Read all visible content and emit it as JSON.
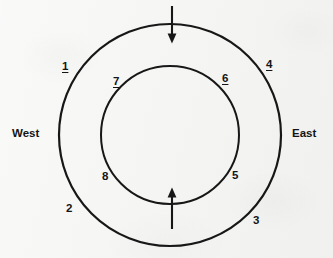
{
  "figure": {
    "type": "concentric-circles-diagram",
    "background_color": "#f3f3f1",
    "stroke_color": "#171717",
    "outer_circle": {
      "center_x": 170,
      "center_y": 135,
      "radius": 111,
      "stroke_width": 2.2
    },
    "inner_circle": {
      "center_x": 170,
      "center_y": 135,
      "radius": 69,
      "stroke_width": 2.0
    },
    "direction_labels": {
      "west": "West",
      "east": "East"
    },
    "numbered_points": [
      {
        "id": "1",
        "label": "1",
        "underlined": true,
        "x": 62,
        "y": 61
      },
      {
        "id": "2",
        "label": "2",
        "underlined": false,
        "x": 66,
        "y": 203
      },
      {
        "id": "3",
        "label": "3",
        "underlined": false,
        "x": 253,
        "y": 215
      },
      {
        "id": "4",
        "label": "4",
        "underlined": true,
        "x": 266,
        "y": 59
      },
      {
        "id": "5",
        "label": "5",
        "underlined": false,
        "x": 232,
        "y": 170
      },
      {
        "id": "6",
        "label": "6",
        "underlined": true,
        "x": 222,
        "y": 73
      },
      {
        "id": "7",
        "label": "7",
        "underlined": true,
        "x": 113,
        "y": 76
      },
      {
        "id": "8",
        "label": "8",
        "underlined": false,
        "x": 102,
        "y": 171
      }
    ],
    "arrows": [
      {
        "id": "top-arrow",
        "name": "inward-flow-arrow-top",
        "direction": "down",
        "x": 172,
        "y_start": 6,
        "y_end": 42
      },
      {
        "id": "bottom-arrow",
        "name": "inward-flow-arrow-bottom",
        "direction": "up",
        "x": 172,
        "y_start": 228,
        "y_end": 188
      }
    ]
  }
}
